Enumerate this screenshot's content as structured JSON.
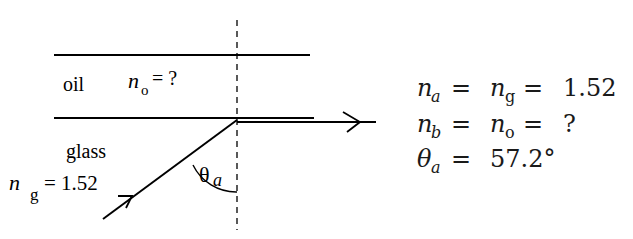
{
  "diagram": {
    "type": "refraction-total-internal-reflection",
    "media": {
      "top": {
        "label": "oil",
        "symbol": "n",
        "subscript": "o",
        "value_text": "= ?"
      },
      "bottom": {
        "label": "glass",
        "symbol": "n",
        "subscript": "g",
        "value_text": "= 1.52"
      }
    },
    "angle_label": {
      "symbol": "θ",
      "subscript": "a"
    },
    "equations": [
      {
        "lhs": "n",
        "lhs_sub": "a",
        "mid": "n",
        "mid_sub": "g",
        "rhs": "1.52"
      },
      {
        "lhs": "n",
        "lhs_sub": "b",
        "mid": "n",
        "mid_sub": "o",
        "rhs": "?"
      },
      {
        "lhs": "θ",
        "lhs_sub": "a",
        "rhs": "57.2°"
      }
    ],
    "colors": {
      "line": "#000000",
      "background": "#ffffff"
    }
  }
}
